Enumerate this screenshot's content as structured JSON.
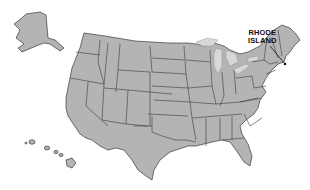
{
  "map": {
    "title": "United States map",
    "highlighted_state": "Rhode Island",
    "label_lines": [
      "RHODE",
      "ISLAND"
    ],
    "colors": {
      "land": "#b4b4b4",
      "border": "#3a3a3a",
      "background": "#ffffff",
      "lakes": "#d8d8d8",
      "label": "#111111"
    },
    "insets": [
      "Alaska",
      "Hawaii"
    ]
  }
}
